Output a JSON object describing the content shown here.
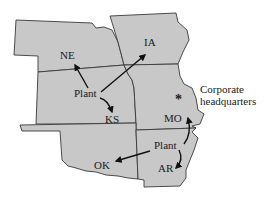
{
  "map": {
    "states": [
      {
        "id": "NE",
        "label": "NE"
      },
      {
        "id": "IA",
        "label": "IA"
      },
      {
        "id": "KS",
        "label": "KS"
      },
      {
        "id": "MO",
        "label": "MO"
      },
      {
        "id": "OK",
        "label": "OK"
      },
      {
        "id": "AR",
        "label": "AR"
      }
    ],
    "plants": [
      {
        "label": "Plant",
        "ships_to": [
          "NE",
          "IA",
          "KS"
        ]
      },
      {
        "label": "Plant",
        "ships_to": [
          "MO",
          "OK",
          "AR"
        ]
      }
    ],
    "headquarters": {
      "marker": "*",
      "line1": "Corporate",
      "line2": "headquarters"
    },
    "colors": {
      "state_fill": "#c8c8c8",
      "border": "#3a3a3a",
      "background": "#ffffff"
    }
  }
}
